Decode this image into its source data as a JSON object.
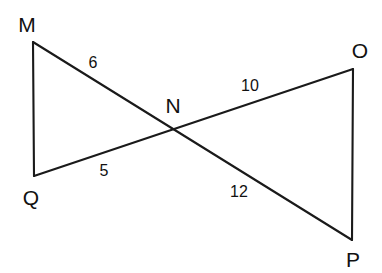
{
  "figure": {
    "background_color": "#ffffff",
    "line_color": "#1a1a1a",
    "text_color": "#111111",
    "vertices": {
      "M": {
        "label": "M",
        "x": 33,
        "y": 42,
        "label_x": 27,
        "label_y": 24
      },
      "Q": {
        "label": "Q",
        "x": 34,
        "y": 176,
        "label_x": 31,
        "label_y": 197
      },
      "N": {
        "label": "N",
        "x": 175,
        "y": 128,
        "label_x": 173,
        "label_y": 105
      },
      "O": {
        "label": "O",
        "x": 353,
        "y": 69,
        "label_x": 360,
        "label_y": 50
      },
      "P": {
        "label": "P",
        "x": 352,
        "y": 240,
        "label_x": 353,
        "label_y": 259
      }
    },
    "segments": [
      {
        "name": "segment-MQ",
        "from": "M",
        "to": "Q"
      },
      {
        "name": "segment-MP",
        "from": "M",
        "to": "P"
      },
      {
        "name": "segment-QO",
        "from": "Q",
        "to": "O"
      },
      {
        "name": "segment-OP",
        "from": "O",
        "to": "P"
      }
    ],
    "measures": [
      {
        "name": "measure-MN",
        "value": "6",
        "x": 93,
        "y": 63
      },
      {
        "name": "measure-QN",
        "value": "5",
        "x": 104,
        "y": 171
      },
      {
        "name": "measure-NO",
        "value": "10",
        "x": 250,
        "y": 86
      },
      {
        "name": "measure-NP",
        "value": "12",
        "x": 239,
        "y": 192
      }
    ]
  }
}
